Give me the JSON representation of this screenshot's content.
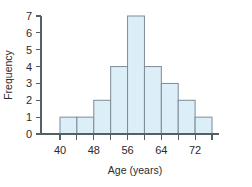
{
  "chart_data": {
    "type": "bar",
    "title": "",
    "subtitle": "",
    "xlabel": "Age (years)",
    "ylabel": "Frequency",
    "grid": false,
    "legend": false,
    "legend_position": "none",
    "bin_width": 4,
    "x_tick_labels": [
      "40",
      "48",
      "56",
      "64",
      "72"
    ],
    "x_tick_values": [
      40,
      48,
      56,
      64,
      72
    ],
    "x_minor_tick_values": [
      44,
      52,
      60,
      68,
      76
    ],
    "y_tick_labels": [
      "0",
      "1",
      "2",
      "3",
      "4",
      "5",
      "6",
      "7"
    ],
    "y_tick_values": [
      0,
      1,
      2,
      3,
      4,
      5,
      6,
      7
    ],
    "xlim": [
      40,
      76
    ],
    "ylim": [
      0,
      7
    ],
    "categories": [
      "40-44",
      "44-48",
      "48-52",
      "52-56",
      "56-60",
      "60-64",
      "64-68",
      "68-72",
      "72-76"
    ],
    "bin_starts": [
      40,
      44,
      48,
      52,
      56,
      60,
      64,
      68,
      72
    ],
    "bin_ends": [
      44,
      48,
      52,
      56,
      60,
      64,
      68,
      72,
      76
    ],
    "values": [
      1,
      1,
      2,
      4,
      7,
      4,
      3,
      2,
      1
    ],
    "bar_fill_color": "#dceef8",
    "bar_edge_color": "#7d8b95",
    "axis_color": "#555f66",
    "text_color": "#2b2b2b",
    "background_color": "#ffffff"
  }
}
